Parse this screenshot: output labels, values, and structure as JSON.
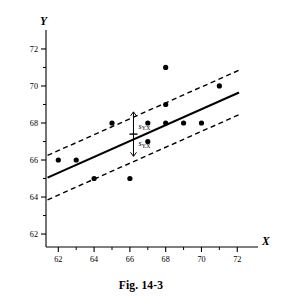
{
  "figure": {
    "caption": "Fig. 14-3",
    "axis_titles": {
      "x": "X",
      "y": "Y"
    },
    "annotations": [
      {
        "id": "upper-band-label",
        "base": "s",
        "sub": "Y.X"
      },
      {
        "id": "lower-band-label",
        "base": "s",
        "sub": "Y.X"
      }
    ]
  },
  "chart_data": {
    "type": "scatter",
    "title": "",
    "xlabel": "X",
    "ylabel": "Y",
    "xlim": [
      61.2,
      72.6
    ],
    "ylim": [
      61.3,
      72.7
    ],
    "x_ticks": [
      62,
      64,
      66,
      68,
      70,
      72
    ],
    "x_ticks_minor": [
      63,
      65,
      67,
      69,
      71
    ],
    "y_ticks": [
      62,
      64,
      66,
      68,
      70,
      72
    ],
    "y_ticks_minor": [
      63,
      65,
      67,
      69,
      71
    ],
    "x_tick_labels": [
      "62",
      "64",
      "66",
      "68",
      "70",
      "72"
    ],
    "y_tick_labels": [
      "62",
      "64",
      "66",
      "68",
      "70",
      "72"
    ],
    "grid": false,
    "legend": null,
    "points": [
      {
        "x": 62,
        "y": 66
      },
      {
        "x": 63,
        "y": 66
      },
      {
        "x": 64,
        "y": 65
      },
      {
        "x": 65,
        "y": 68
      },
      {
        "x": 66,
        "y": 65
      },
      {
        "x": 67,
        "y": 68
      },
      {
        "x": 67,
        "y": 67
      },
      {
        "x": 68,
        "y": 71
      },
      {
        "x": 68,
        "y": 69
      },
      {
        "x": 68,
        "y": 68
      },
      {
        "x": 69,
        "y": 68
      },
      {
        "x": 70,
        "y": 68
      },
      {
        "x": 71,
        "y": 70
      },
      {
        "x": 66.2,
        "y": 67.4
      }
    ],
    "regression_line": {
      "style": "solid",
      "x_start": 61.4,
      "y_start": 65.05,
      "x_end": 72.1,
      "y_end": 69.65
    },
    "band_lines": [
      {
        "name": "upper-band",
        "style": "dashed",
        "x_start": 61.4,
        "y_start": 66.25,
        "x_end": 72.1,
        "y_end": 70.85
      },
      {
        "name": "lower-band",
        "style": "dashed",
        "x_start": 61.4,
        "y_start": 63.85,
        "x_end": 72.1,
        "y_end": 68.45
      }
    ],
    "error_bar": {
      "x": 66.2,
      "y_center": 67.4,
      "y_upper": 68.6,
      "y_lower": 66.2,
      "label": "s_Y.X"
    }
  }
}
